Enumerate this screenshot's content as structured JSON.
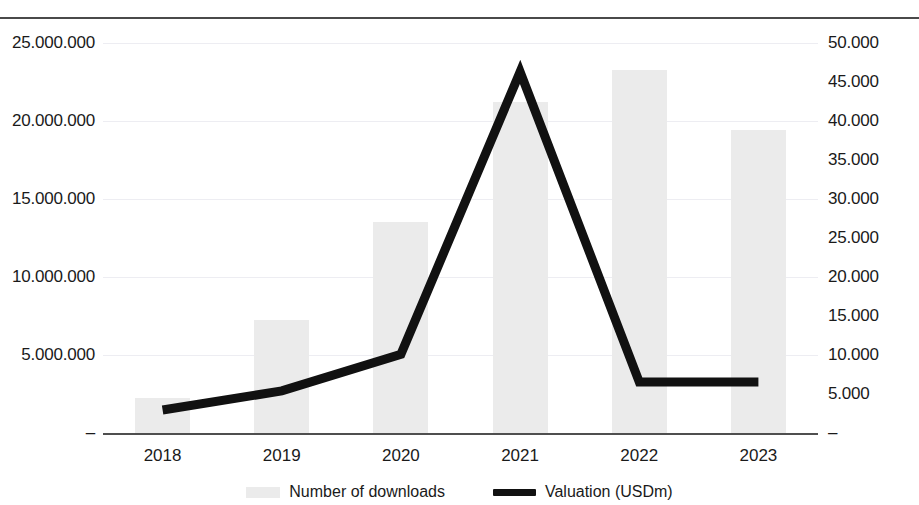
{
  "chart_data": {
    "type": "bar",
    "title": "",
    "subtitle": "",
    "xlabel": "",
    "categories": [
      "2018",
      "2019",
      "2020",
      "2021",
      "2022",
      "2023"
    ],
    "series": [
      {
        "name": "Number of downloads",
        "type": "bar",
        "axis": "left",
        "color": "#ebebeb",
        "values": [
          2240000,
          7240000,
          13500000,
          21200000,
          23300000,
          19400000
        ]
      },
      {
        "name": "Valuation (USDm)",
        "type": "line",
        "axis": "right",
        "color": "#111111",
        "values": [
          2950,
          5400,
          10100,
          46300,
          6540,
          6540
        ]
      }
    ],
    "axes": {
      "left": {
        "label": "",
        "min": 0,
        "max": 25000000,
        "step": 5000000,
        "tick_labels": [
          "–",
          "5.000.000",
          "10.000.000",
          "15.000.000",
          "20.000.000",
          "25.000.000"
        ]
      },
      "right": {
        "label": "",
        "min": 0,
        "max": 50000,
        "step": 5000,
        "tick_labels": [
          "–",
          "5.000",
          "10.000",
          "15.000",
          "20.000",
          "25.000",
          "30.000",
          "35.000",
          "40.000",
          "45.000",
          "50.000"
        ]
      }
    },
    "grid": true,
    "legend_position": "bottom"
  },
  "legend": {
    "entries": [
      {
        "label": "Number of downloads",
        "marker": "bar-swatch"
      },
      {
        "label": "Valuation (USDm)",
        "marker": "line-swatch"
      }
    ]
  }
}
